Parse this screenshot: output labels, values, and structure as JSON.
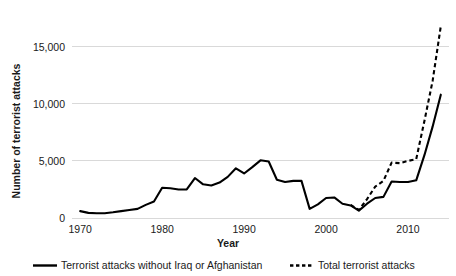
{
  "chart_data": {
    "type": "line",
    "title": "",
    "xlabel": "Year",
    "ylabel": "Number of terrorist attacks",
    "xlim": [
      1969,
      1915
    ],
    "x_range": [
      1969,
      2015
    ],
    "ylim": [
      0,
      18000
    ],
    "grid": "horizontal",
    "legend_position": "bottom",
    "y_ticks": [
      0,
      5000,
      10000,
      15000
    ],
    "y_tick_labels": [
      "0",
      "5,000",
      "10,000",
      "15,000"
    ],
    "x_ticks": [
      1970,
      1980,
      1990,
      2000,
      2010
    ],
    "x_tick_labels": [
      "1970",
      "1980",
      "1990",
      "2000",
      "2010"
    ],
    "x": [
      1970,
      1971,
      1972,
      1973,
      1974,
      1975,
      1976,
      1977,
      1978,
      1979,
      1980,
      1981,
      1982,
      1983,
      1984,
      1985,
      1986,
      1987,
      1988,
      1989,
      1990,
      1991,
      1992,
      1993,
      1994,
      1995,
      1996,
      1997,
      1998,
      1999,
      2000,
      2001,
      2002,
      2003,
      2004,
      2005,
      2006,
      2007,
      2008,
      2009,
      2010,
      2011,
      2012,
      2013,
      2014
    ],
    "series": [
      {
        "name": "Terrorist attacks without Iraq or Afghanistan",
        "style": "solid",
        "color": "#000000",
        "values": [
          600,
          450,
          420,
          420,
          500,
          600,
          700,
          800,
          1150,
          1450,
          2650,
          2600,
          2500,
          2500,
          3500,
          2950,
          2850,
          3100,
          3600,
          4350,
          3900,
          4450,
          5050,
          4950,
          3350,
          3150,
          3250,
          3250,
          800,
          1200,
          1750,
          1800,
          1250,
          1100,
          650,
          1250,
          1750,
          1850,
          3200,
          3150,
          3150,
          3300,
          5500,
          8000,
          10800
        ]
      },
      {
        "name": "Total terrorist attacks",
        "style": "dashed",
        "color": "#000000",
        "values": [
          null,
          null,
          null,
          null,
          null,
          null,
          null,
          null,
          null,
          null,
          null,
          null,
          null,
          null,
          null,
          null,
          null,
          null,
          null,
          null,
          null,
          null,
          null,
          null,
          null,
          null,
          null,
          null,
          null,
          null,
          null,
          null,
          null,
          1150,
          700,
          1650,
          2750,
          3250,
          4850,
          4800,
          5000,
          5150,
          8500,
          12000,
          16800
        ]
      }
    ]
  },
  "axes": {
    "y_title": "Number of terrorist attacks",
    "x_title": "Year"
  },
  "legend": {
    "items": [
      {
        "label": "Terrorist attacks without Iraq or Afghanistan",
        "style": "solid"
      },
      {
        "label": "Total terrorist attacks",
        "style": "dashed"
      }
    ]
  }
}
